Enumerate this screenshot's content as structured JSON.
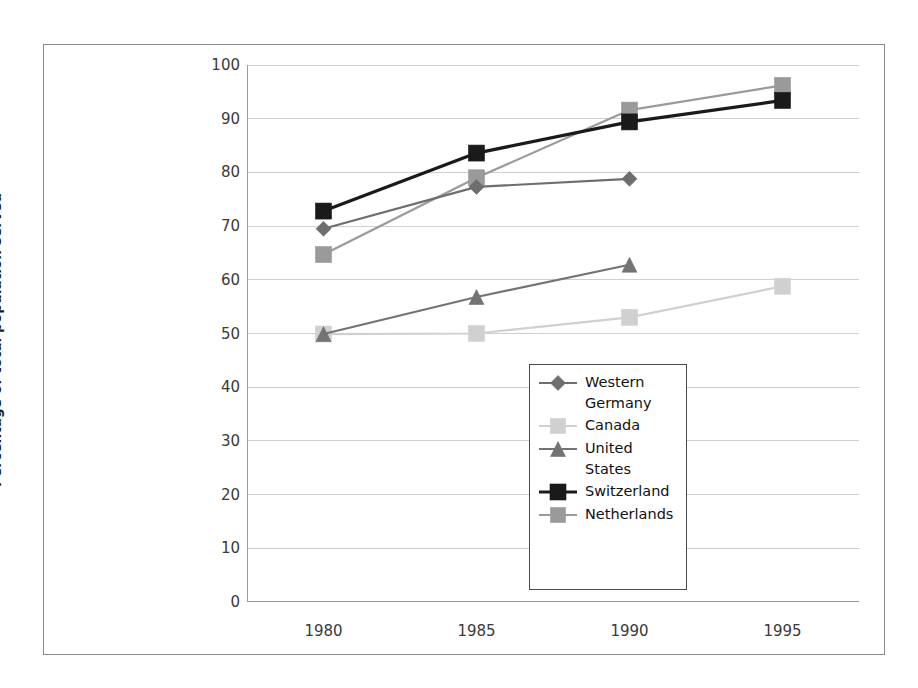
{
  "chart_data": {
    "type": "line",
    "title": "",
    "xlabel": "",
    "ylabel": "Percentage of total population served",
    "categories": [
      "1980",
      "1985",
      "1990",
      "1995"
    ],
    "x": [
      1980,
      1985,
      1990,
      1995
    ],
    "ylim": [
      0,
      100
    ],
    "xlim": [
      1977.5,
      1997.5
    ],
    "yticks": [
      0,
      10,
      20,
      30,
      40,
      50,
      60,
      70,
      80,
      90,
      100
    ],
    "ytick_labels": [
      "0",
      "10",
      "20",
      "30",
      "40",
      "50",
      "60",
      "70",
      "80",
      "90",
      "100"
    ],
    "grid": true,
    "grid_axis": "y",
    "legend_position": "center-right-inside",
    "series": [
      {
        "name": "Western Germany",
        "color": "#6e6e6e",
        "marker": "diamond",
        "values": [
          69.5,
          77.3,
          78.8,
          null
        ]
      },
      {
        "name": "Canada",
        "color": "#d0d0d0",
        "marker": "square",
        "values": [
          49.9,
          50.0,
          53.0,
          58.8
        ]
      },
      {
        "name": "United States",
        "color": "#737373",
        "marker": "triangle",
        "values": [
          49.9,
          56.8,
          62.8,
          null
        ]
      },
      {
        "name": "Switzerland",
        "color": "#1a1a1a",
        "marker": "square",
        "values": [
          72.8,
          83.6,
          89.4,
          93.4
        ]
      },
      {
        "name": "Netherlands",
        "color": "#9a9a9a",
        "marker": "square",
        "values": [
          64.7,
          79.0,
          91.6,
          96.2
        ]
      }
    ]
  },
  "legend": {
    "items": [
      {
        "label": "Western Germany",
        "marker": "diamond-icon",
        "color": "#6e6e6e"
      },
      {
        "label": "Canada",
        "marker": "square-icon",
        "color": "#d0d0d0"
      },
      {
        "label": "United States",
        "marker": "triangle-icon",
        "color": "#737373"
      },
      {
        "label": "Switzerland",
        "marker": "square-icon",
        "color": "#1a1a1a"
      },
      {
        "label": "Netherlands",
        "marker": "square-icon",
        "color": "#9a9a9a"
      }
    ]
  },
  "axes": {
    "y_title": "Percentage of total population served",
    "y_labels": [
      "100",
      "90",
      "80",
      "70",
      "60",
      "50",
      "40",
      "30",
      "20",
      "10",
      "0"
    ],
    "x_labels": [
      "1980",
      "1985",
      "1990",
      "1995"
    ]
  },
  "colors": {
    "frame": "#8c8c8c",
    "grid": "#cfcfcf",
    "axis": "#9a9a9a",
    "text": "#3a3a3a",
    "legend_border": "#4a4a4a"
  }
}
